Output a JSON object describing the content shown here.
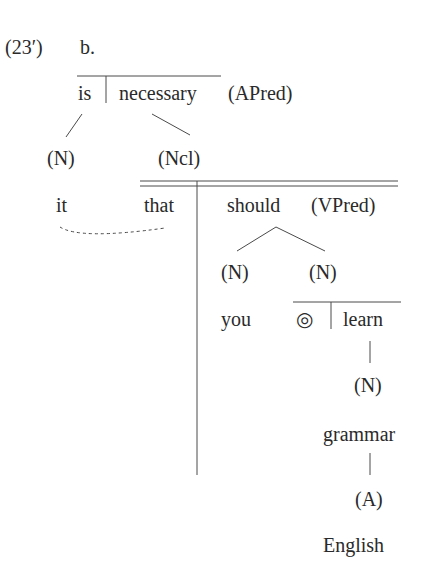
{
  "example": {
    "number": "(23′)",
    "sub": "b."
  },
  "tree": {
    "root": {
      "left": "is",
      "right": "necessary",
      "label": "(APred)"
    },
    "n_it": {
      "category": "(N)",
      "word": "it"
    },
    "ncl": {
      "category": "(Ncl)",
      "complementizer": "that"
    },
    "clause_pred": {
      "word": "should",
      "label": "(VPred)"
    },
    "n_you": {
      "category": "(N)",
      "word": "you"
    },
    "n_learn": {
      "category": "(N)",
      "symbol": "◎",
      "word": "learn"
    },
    "n_grammar": {
      "category": "(N)",
      "word": "grammar"
    },
    "a_english": {
      "category": "(A)",
      "word": "English"
    }
  },
  "colors": {
    "text": "#2a2a2a",
    "line": "#4a4a4a"
  }
}
